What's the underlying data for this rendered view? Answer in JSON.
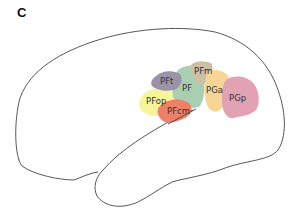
{
  "panel": {
    "label": "C"
  },
  "regions": [
    {
      "id": "PFt",
      "label": "PFt",
      "color": "#9b94a8"
    },
    {
      "id": "PF",
      "label": "PF",
      "color": "#a9cfb3"
    },
    {
      "id": "PFm",
      "label": "PFm",
      "color": "#cdbfa6"
    },
    {
      "id": "PFop",
      "label": "PFop",
      "color": "#f6f59a"
    },
    {
      "id": "PFcm",
      "label": "PFcm",
      "color": "#ef8068"
    },
    {
      "id": "PGa",
      "label": "PGa",
      "color": "#f7d595"
    },
    {
      "id": "PGp",
      "label": "PGp",
      "color": "#e3a2b4"
    }
  ],
  "outline": {
    "stroke": "#444444"
  }
}
